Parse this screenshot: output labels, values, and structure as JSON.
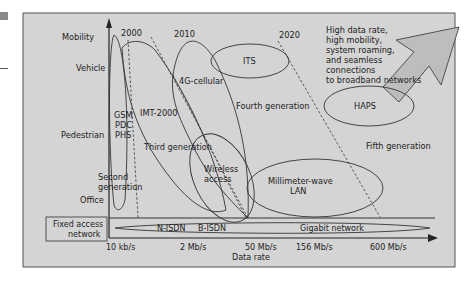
{
  "diagram": {
    "title": "",
    "y_axis": {
      "label": "Mobility",
      "levels": [
        "Vehicle",
        "Pedestrian",
        "Office"
      ]
    },
    "x_axis": {
      "label": "Data rate",
      "ticks": [
        "10 kb/s",
        "2 Mb/s",
        "50 Mb/s",
        "156 Mb/s",
        "600 Mb/s"
      ]
    },
    "years": [
      "2000",
      "2010",
      "2020"
    ],
    "regions": {
      "gsm": [
        "GSM",
        "PDC",
        "PHS"
      ],
      "second_gen": [
        "Second",
        "generation"
      ],
      "imt2000": "IMT-2000",
      "third_gen": "Third generation",
      "cellular_4g": "4G-cellular",
      "its": "ITS",
      "fourth_gen": "Fourth generation",
      "haps": "HAPS",
      "fifth_gen": "Fifth generation",
      "wireless_access": [
        "Wireless",
        "access"
      ],
      "mm_wave": [
        "Millimeter-wave",
        "LAN"
      ]
    },
    "fixed_access": {
      "label": [
        "Fixed access",
        "network"
      ],
      "items": [
        "N-ISDN",
        "B-ISDN",
        "Gigabit network"
      ]
    },
    "trend_note": [
      "High data rate,",
      "high mobility,",
      "system roaming,",
      "and seamless",
      "connections",
      "to broadband networks"
    ],
    "colors": {
      "background": "#d4d4d4",
      "arrow_fill": "#bdbdbd",
      "line": "#333333",
      "text": "#222222"
    }
  }
}
